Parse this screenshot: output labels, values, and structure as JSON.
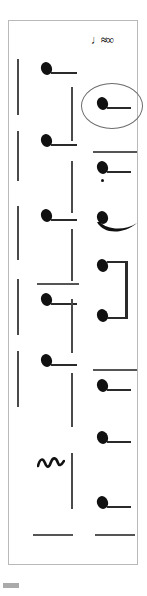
{
  "figure": {
    "type": "music-notation-excerpt",
    "title": "Music notation excerpt",
    "frame": {
      "border_color": "#b9b9b9",
      "background": "#ffffff"
    },
    "annotation": {
      "name": "ellipse-highlight",
      "shape": "ellipse",
      "color": "#6b6b6b",
      "target": "right-column-note-1",
      "note": "circled note"
    },
    "tempo_mark": {
      "label": "♩≈∞",
      "description": "small bold marking at top right"
    },
    "columns": [
      {
        "name": "left-column",
        "systems": [
          {
            "id": "L1",
            "barline": true,
            "note": "quarter-note-with-stem",
            "ledger": false
          },
          {
            "id": "L2",
            "barline": true,
            "note": "quarter-note-with-stem",
            "ledger": false
          },
          {
            "id": "L3",
            "barline": true,
            "note": "quarter-note-with-stem",
            "ledger": false
          },
          {
            "id": "L4",
            "barline": true,
            "note": "quarter-note-with-stem",
            "ledger": true
          },
          {
            "id": "L5",
            "barline": true,
            "note": "quarter-note-with-stem",
            "ledger": false
          },
          {
            "id": "L6",
            "barline": false,
            "note": "mordent-ornament",
            "ledger": false
          },
          {
            "id": "L7",
            "barline": false,
            "note": "rest-line",
            "ledger": false
          }
        ]
      },
      {
        "name": "right-column",
        "systems": [
          {
            "id": "R1",
            "barline": true,
            "note": "quarter-note-with-stem",
            "highlighted": true
          },
          {
            "id": "R2",
            "barline": true,
            "note": "quarter-note-staccato-with-ledger"
          },
          {
            "id": "R3",
            "barline": true,
            "note": "quarter-note-with-slur"
          },
          {
            "id": "R4",
            "barline": true,
            "note": "beamed-note-pair"
          },
          {
            "id": "R5",
            "barline": true,
            "note": "quarter-note-with-ledger"
          },
          {
            "id": "R6",
            "barline": true,
            "note": "quarter-note-with-stem"
          },
          {
            "id": "R7",
            "barline": false,
            "note": "quarter-note-with-stem"
          },
          {
            "id": "R8",
            "barline": false,
            "note": "rest-line"
          }
        ]
      }
    ],
    "colors": {
      "ink": "#111111",
      "staff": "#4a4a4a",
      "frame": "#b9b9b9"
    }
  }
}
